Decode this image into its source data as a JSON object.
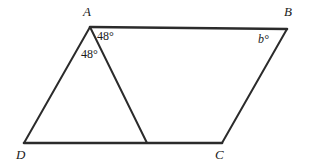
{
  "figure": {
    "kind": "geometry-diagram",
    "background_color": "#ffffff",
    "stroke_color": "#2b2b2b",
    "text_color": "#1a1a1a",
    "canvas": {
      "width": 311,
      "height": 166
    },
    "vertices": [
      {
        "name": "A",
        "label": "A",
        "x": 90,
        "y": 27
      },
      {
        "name": "B",
        "label": "B",
        "x": 287,
        "y": 29
      },
      {
        "name": "C",
        "label": "C",
        "x": 222,
        "y": 143
      },
      {
        "name": "D",
        "label": "D",
        "x": 24,
        "y": 143
      },
      {
        "name": "E",
        "label": "",
        "x": 147,
        "y": 143
      }
    ],
    "edges": [
      {
        "name": "side-AB",
        "from": "A",
        "to": "B",
        "width": 2.6
      },
      {
        "name": "side-BC",
        "from": "B",
        "to": "C",
        "width": 2.0
      },
      {
        "name": "side-DC",
        "from": "D",
        "to": "C",
        "width": 2.6
      },
      {
        "name": "side-DA",
        "from": "D",
        "to": "A",
        "width": 2.0
      },
      {
        "name": "segment-AE",
        "from": "A",
        "to": "E",
        "width": 2.0
      }
    ],
    "angle_labels": [
      {
        "name": "angle-at-A-right",
        "text": "48°",
        "at_vertex": "A",
        "x": 97,
        "y": 30,
        "italic": false
      },
      {
        "name": "angle-at-A-left",
        "text": "48°",
        "at_vertex": "A",
        "x": 81,
        "y": 48,
        "italic": false
      },
      {
        "name": "angle-at-B",
        "text": "b°",
        "at_vertex": "B",
        "x": 258,
        "y": 33,
        "italic": true
      }
    ]
  }
}
